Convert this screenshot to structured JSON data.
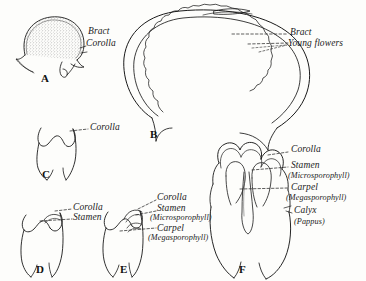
{
  "figure": {
    "background_color": "#fdfdfb",
    "ink_color": "#1a1a1a"
  },
  "panels": [
    {
      "letter": "A",
      "name": "involucral-bract-side-view",
      "labels": [
        "Bract",
        "Corolla"
      ]
    },
    {
      "letter": "B",
      "name": "head-longitudinal-section",
      "labels": [
        "Bract",
        "Young flowers"
      ]
    },
    {
      "letter": "C",
      "name": "corolla-tube-only",
      "labels": [
        "Corolla"
      ]
    },
    {
      "letter": "D",
      "name": "corolla-with-stamen",
      "labels": [
        "Corolla",
        "Stamen"
      ]
    },
    {
      "letter": "E",
      "name": "corolla-stamen-carpel",
      "labels": [
        "Corolla",
        "Stamen",
        "(Microsporophyll)",
        "Carpel",
        "(Megasporophyll)"
      ]
    },
    {
      "letter": "F",
      "name": "complete-floret-section",
      "labels": [
        "Corolla",
        "Stamen",
        "(Microsporophyll)",
        "Carpel",
        "(Megasporophyll)",
        "Calyx",
        "(Pappus)"
      ]
    }
  ],
  "labels": {
    "a_bract": "Bract",
    "a_corolla": "Corolla",
    "b_bract": "Bract",
    "b_young_flowers": "Young flowers",
    "c_corolla": "Corolla",
    "d_corolla": "Corolla",
    "d_stamen": "Stamen",
    "e_corolla": "Corolla",
    "e_stamen": "Stamen",
    "e_microsporophyll": "(Microsporophyll)",
    "e_carpel": "Carpel",
    "e_megasporophyll": "(Megasporophyll)",
    "f_corolla": "Corolla",
    "f_stamen": "Stamen",
    "f_microsporophyll": "(Microsporophyll)",
    "f_carpel": "Carpel",
    "f_megasporophyll": "(Megasporophyll)",
    "f_calyx": "Calyx",
    "f_pappus": "(Pappus)"
  },
  "panel_letters": {
    "a": "A",
    "b": "B",
    "c": "C",
    "d": "D",
    "e": "E",
    "f": "F"
  }
}
